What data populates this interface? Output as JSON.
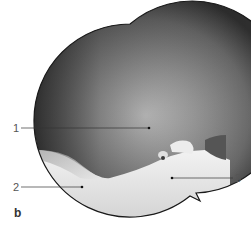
{
  "figure": {
    "panel_letter": "b",
    "labels": [
      {
        "number": "1",
        "x": 13,
        "y": 123
      },
      {
        "number": "2",
        "x": 13,
        "y": 182
      },
      {
        "number": "3",
        "x": 233,
        "y": 173
      }
    ]
  }
}
